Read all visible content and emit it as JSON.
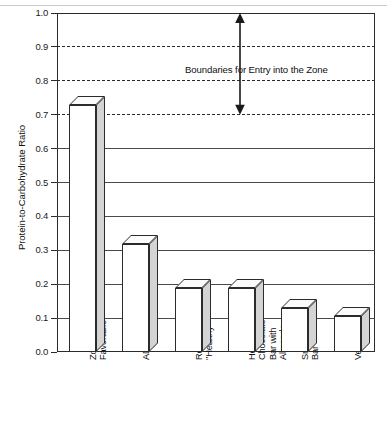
{
  "chart_data": {
    "type": "bar",
    "title": "",
    "xlabel": "",
    "ylabel": "Protein-to-Carbohydrate Ratio",
    "ylim": [
      0.0,
      1.0
    ],
    "ytick_labels": [
      "0.0",
      "0.1",
      "0.2",
      "0.3",
      "0.4",
      "0.5",
      "0.6",
      "0.7",
      "0.8",
      "0.9",
      "1.0"
    ],
    "ytick_values": [
      0.0,
      0.1,
      0.2,
      0.3,
      0.4,
      0.5,
      0.6,
      0.7,
      0.8,
      0.9,
      1.0
    ],
    "grid": true,
    "grid_style": "solid gridlines at 0.1-0.6; dashed gridlines at 0.7, 0.8, 0.9",
    "dashed_gridlines": [
      0.7,
      0.8,
      0.9
    ],
    "legend": "none",
    "categories": [
      "Zone-\nFavorable",
      "ADA",
      "Recommended\n\"Healthy\"",
      "Hershey\nChocolate\nBar with\nAlmonds",
      "Snickers\nBar",
      "Vegetarian"
    ],
    "values": [
      0.73,
      0.32,
      0.19,
      0.19,
      0.13,
      0.105
    ],
    "annotations": [
      {
        "text": "Boundaries for Entry into the Zone",
        "type": "label",
        "y_range": [
          0.7,
          1.0
        ]
      },
      {
        "text": "",
        "type": "double-headed-arrow",
        "y_range": [
          0.7,
          1.0
        ]
      }
    ],
    "style": "3D extruded bars, white front face, gray right side face"
  },
  "colors": {
    "bar_front": "#ffffff",
    "bar_side": "#d4d4d4",
    "bar_top": "#fbfbfb",
    "outline": "#2b2b2b",
    "gridline": "#4a4a4a",
    "background": "#ffffff",
    "text": "#111111"
  }
}
